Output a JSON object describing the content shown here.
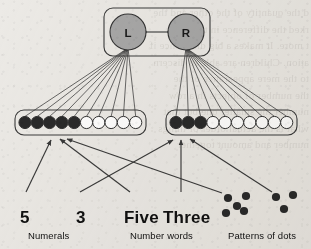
{
  "figure": {
    "type": "neural-network-diagram",
    "background_note": "scanned book page, faint reverse-side text bleed-through"
  },
  "hidden_layer": {
    "container_label": "hidden-layer-box",
    "nodes": [
      {
        "id": "L",
        "label": "L",
        "cx": 128,
        "cy": 32,
        "r": 18,
        "fill": "#a8a8a8",
        "stroke": "#333333"
      },
      {
        "id": "R",
        "label": "R",
        "cx": 186,
        "cy": 32,
        "r": 18,
        "fill": "#a8a8a8",
        "stroke": "#333333"
      }
    ],
    "link": {
      "from": "L",
      "to": "R",
      "bidirectional": true
    },
    "box": {
      "x": 104,
      "y": 8,
      "width": 106,
      "height": 48,
      "rx": 9
    }
  },
  "output_layers": [
    {
      "name": "left-output-layer",
      "box": {
        "x": 15,
        "y": 110,
        "width": 131,
        "height": 25,
        "rx": 9
      },
      "source_node": "L",
      "total_units": 10,
      "active_units": 5,
      "unit_r": 6.1,
      "first_cx": 25,
      "spacing": 12.3,
      "cy": 122.5
    },
    {
      "name": "right-output-layer",
      "box": {
        "x": 166,
        "y": 110,
        "width": 131,
        "height": 25,
        "rx": 9
      },
      "source_node": "R",
      "total_units": 10,
      "active_units": 3,
      "unit_r": 6.1,
      "first_cx": 176,
      "spacing": 12.3,
      "cy": 122.5
    }
  ],
  "colors": {
    "unit_filled": "#2a2a2a",
    "unit_empty": "#ffffff",
    "unit_stroke": "#333333",
    "node_fill": "#a8a8a8",
    "line": "#3a3a3a",
    "text": "#111111",
    "paper": "#eceae6"
  },
  "inputs": [
    {
      "id": "numeral-five",
      "kind": "text",
      "label": "5",
      "x": 20,
      "y": 208,
      "target_layer": "left-output-layer",
      "arrow": {
        "x1": 26,
        "y1": 192,
        "x2": 51,
        "y2": 140
      }
    },
    {
      "id": "numeral-three",
      "kind": "text",
      "label": "3",
      "x": 76,
      "y": 208,
      "target_layer": "right-output-layer",
      "arrow": {
        "x1": 80,
        "y1": 192,
        "x2": 173,
        "y2": 140
      }
    },
    {
      "id": "word-five",
      "kind": "text",
      "label": "Five",
      "x": 124,
      "y": 208,
      "target_layer": "left-output-layer",
      "arrow": {
        "x1": 130,
        "y1": 192,
        "x2": 60,
        "y2": 139
      }
    },
    {
      "id": "word-three",
      "kind": "text",
      "label": "Three",
      "x": 163,
      "y": 208,
      "target_layer": "right-output-layer",
      "arrow": {
        "x1": 181,
        "y1": 192,
        "x2": 181,
        "y2": 140
      }
    },
    {
      "id": "dots-five",
      "kind": "dot-pattern",
      "count": 5,
      "arrangement": "quincunx",
      "dots": [
        {
          "cx": 228,
          "cy": 198
        },
        {
          "cx": 246,
          "cy": 196
        },
        {
          "cx": 237,
          "cy": 206
        },
        {
          "cx": 226,
          "cy": 213
        },
        {
          "cx": 244,
          "cy": 211
        }
      ],
      "dot_r": 4.1,
      "target_layer": "left-output-layer",
      "arrow": {
        "x1": 222,
        "y1": 193,
        "x2": 67,
        "y2": 139
      }
    },
    {
      "id": "dots-three",
      "kind": "dot-pattern",
      "count": 3,
      "arrangement": "triangle",
      "dots": [
        {
          "cx": 276,
          "cy": 197
        },
        {
          "cx": 293,
          "cy": 195
        },
        {
          "cx": 284,
          "cy": 209
        }
      ],
      "dot_r": 4.1,
      "target_layer": "right-output-layer",
      "arrow": {
        "x1": 272,
        "y1": 192,
        "x2": 190,
        "y2": 139
      }
    }
  ],
  "captions": [
    {
      "id": "caption-numerals",
      "label": "Numerals",
      "x": 28,
      "y": 230
    },
    {
      "id": "caption-number-words",
      "label": "Number words",
      "x": 130,
      "y": 230
    },
    {
      "id": "caption-patterns-of-dots",
      "label": "Patterns of dots",
      "x": 228,
      "y": 230
    }
  ],
  "bleed_text": "d the quantity of the other and the\nrked the difference in the two\nt more. It makes a big difference if\nation. Children are able to discern\nto the mere appearance of the\nthe number of objects in a row\nnumber the smaller one but that\nwhat is the actual order of things\nnumber and amount together"
}
